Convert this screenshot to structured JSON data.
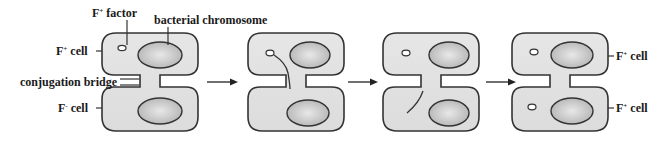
{
  "diagram": {
    "colors": {
      "cell_fill": "#e2e2e2",
      "chromosome_fill": "#bdbdbd",
      "outline": "#333333",
      "background": "#ffffff"
    },
    "labels": {
      "f_factor": "F",
      "f_factor_sup": "+",
      "f_factor_suffix": " factor",
      "bacterial_chromosome": "bacterial chromosome",
      "f_plus_cell_left": "F",
      "f_plus_cell_left_sup": "+",
      "f_plus_cell_left_suffix": " cell",
      "conjugation_bridge": "conjugation bridge",
      "f_minus_cell": "F",
      "f_minus_cell_sup": "-",
      "f_minus_cell_suffix": " cell",
      "f_plus_cell_right_top": "F",
      "f_plus_cell_right_top_sup": "+",
      "f_plus_cell_right_top_suffix": " cell",
      "f_plus_cell_right_bottom": "F",
      "f_plus_cell_right_bottom_sup": "+",
      "f_plus_cell_right_bottom_suffix": " cell"
    },
    "stages": [
      {
        "id": 1,
        "description": "F+ cell connected to F- cell by conjugation bridge"
      },
      {
        "id": 2,
        "description": "F factor strand begins transfer through bridge"
      },
      {
        "id": 3,
        "description": "Single strand transferred into F- cell"
      },
      {
        "id": 4,
        "description": "Both cells now F+ with F factor"
      }
    ],
    "arrows": 3
  }
}
